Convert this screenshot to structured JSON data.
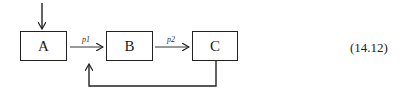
{
  "diagram": {
    "nodes": [
      {
        "id": "A",
        "label": "A"
      },
      {
        "id": "B",
        "label": "B"
      },
      {
        "id": "C",
        "label": "C"
      }
    ],
    "edges": [
      {
        "from": "input",
        "to": "A",
        "label": ""
      },
      {
        "from": "A",
        "to": "B",
        "label": "p1"
      },
      {
        "from": "B",
        "to": "C",
        "label": "p2"
      },
      {
        "from": "C",
        "to": "A-B edge",
        "label": "",
        "type": "feedback"
      }
    ],
    "equation_number": "(14.12)"
  }
}
